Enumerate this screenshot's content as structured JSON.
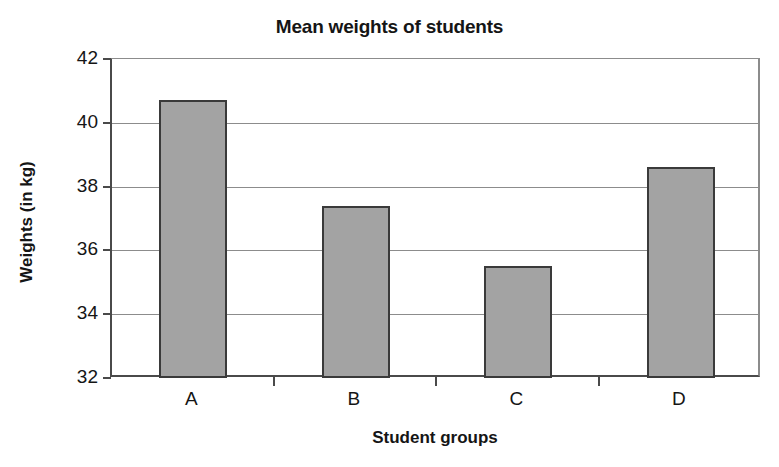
{
  "chart_data": {
    "type": "bar",
    "title": "Mean weights of students",
    "xlabel": "Student groups",
    "ylabel": "Weights (in kg)",
    "categories": [
      "A",
      "B",
      "C",
      "D"
    ],
    "values": [
      40.7,
      37.4,
      35.5,
      38.6
    ],
    "ylim": [
      32,
      42
    ],
    "yticks": [
      32,
      34,
      36,
      38,
      40,
      42
    ],
    "ytick_labels": [
      "32",
      "34",
      "36",
      "38",
      "40",
      "42"
    ],
    "grid": "horizontal",
    "legend": null,
    "series_name": "Mean weight",
    "bar_color": "#a3a3a3",
    "bar_border_color": "#3a3a3a",
    "axis_color": "#4a4a4a",
    "grid_color": "#8c8c8c",
    "background": "#ffffff"
  }
}
